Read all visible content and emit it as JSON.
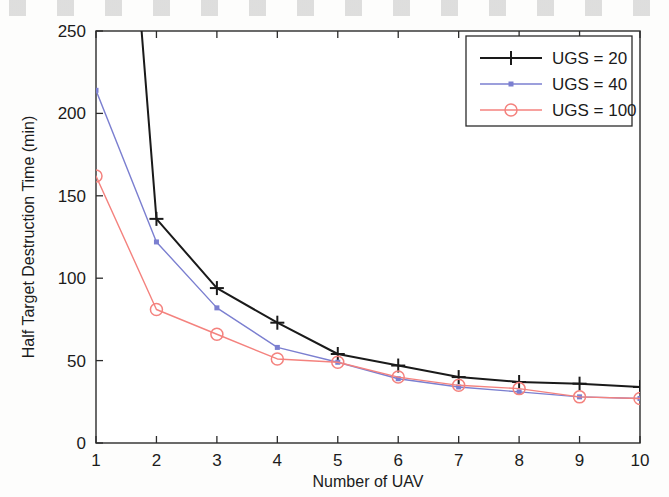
{
  "chart_data": {
    "type": "line",
    "title": "",
    "xlabel": "Number of UAV",
    "ylabel": "Half Target Destruction Time (min)",
    "x": [
      1,
      2,
      3,
      4,
      5,
      6,
      7,
      8,
      9,
      10
    ],
    "xlim": [
      1,
      10
    ],
    "ylim": [
      0,
      250
    ],
    "xticks": [
      "1",
      "2",
      "3",
      "4",
      "5",
      "6",
      "7",
      "8",
      "9",
      "10"
    ],
    "yticks": [
      "0",
      "50",
      "100",
      "150",
      "200",
      "250"
    ],
    "grid": false,
    "legend_position": "top-right",
    "series": [
      {
        "name": "UGS = 20",
        "color": "#1a1a1a",
        "marker": "plus",
        "values": [
          null,
          136,
          94,
          73,
          54,
          47,
          40,
          37,
          36,
          34
        ],
        "note": "first point above axis limit; line enters plot at top edge near x=1.8"
      },
      {
        "name": "UGS = 40",
        "color": "#7b7fd0",
        "marker": "dot",
        "values": [
          214,
          122,
          82,
          58,
          49,
          39,
          34,
          31,
          28,
          27
        ]
      },
      {
        "name": "UGS = 100",
        "color": "#f4827e",
        "marker": "circle",
        "values": [
          162,
          81,
          66,
          51,
          49,
          40,
          35,
          33,
          28,
          27
        ]
      }
    ]
  },
  "legend": {
    "entries": [
      {
        "label": "UGS = 20"
      },
      {
        "label": "UGS = 40"
      },
      {
        "label": "UGS = 100"
      }
    ]
  },
  "axes": {
    "x_title": "Number of UAV",
    "y_title": "Half Target Destruction Time (min)",
    "x_tick_labels": [
      "1",
      "2",
      "3",
      "4",
      "5",
      "6",
      "7",
      "8",
      "9",
      "10"
    ],
    "y_tick_labels": [
      "0",
      "50",
      "100",
      "150",
      "200",
      "250"
    ]
  }
}
